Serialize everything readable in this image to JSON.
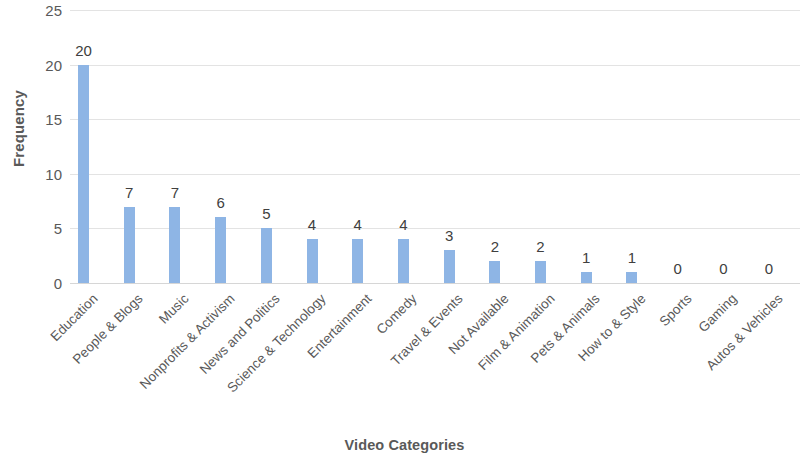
{
  "chart_data": {
    "type": "bar",
    "title": "",
    "xlabel": "Video Categories",
    "ylabel": "Frequency",
    "categories": [
      "Education",
      "People & Blogs",
      "Music",
      "Nonprofits & Activism",
      "News and Politics",
      "Science & Technology",
      "Entertainment",
      "Comedy",
      "Travel & Events",
      "Not Available",
      "Film & Animation",
      "Pets & Animals",
      "How to & Style",
      "Sports",
      "Gaming",
      "Autos & Vehicles"
    ],
    "values": [
      20,
      7,
      7,
      6,
      5,
      4,
      4,
      4,
      3,
      2,
      2,
      1,
      1,
      0,
      0,
      0
    ],
    "value_labels": [
      "20",
      "7",
      "7",
      "6",
      "5",
      "4",
      "4",
      "4",
      "3",
      "2",
      "2",
      "1",
      "1",
      "0",
      "0",
      "0"
    ],
    "ylim": [
      0,
      25
    ],
    "y_ticks": [
      0,
      5,
      10,
      15,
      20,
      25
    ],
    "y_tick_labels": [
      "0",
      "5",
      "10",
      "15",
      "20",
      "25"
    ],
    "grid": true,
    "legend": false,
    "bar_color": "#8EB5E5",
    "grid_color": "#E3E3E3",
    "text_color": "#595959"
  }
}
